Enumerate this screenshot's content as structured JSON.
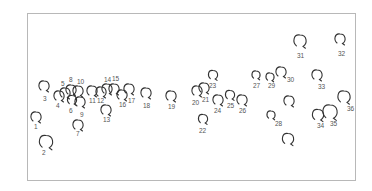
{
  "figure": {
    "border_color": "#b8b8b8",
    "stroke_color": "#333333",
    "label_color": "#555555"
  },
  "items": [
    {
      "id": "1",
      "cx": 36,
      "cy": 117,
      "r": 5,
      "lx": 34,
      "ly": 129
    },
    {
      "id": "2",
      "cx": 46,
      "cy": 142,
      "r": 6.5,
      "lx": 42,
      "ly": 155
    },
    {
      "id": "3",
      "cx": 44,
      "cy": 86,
      "r": 5,
      "lx": 43,
      "ly": 101
    },
    {
      "id": "4",
      "cx": 59,
      "cy": 96,
      "r": 5,
      "lx": 56,
      "ly": 108
    },
    {
      "id": "5",
      "cx": 65,
      "cy": 93,
      "r": 5,
      "lx": 61,
      "ly": 86
    },
    {
      "id": "6",
      "cx": 72,
      "cy": 100,
      "r": 4.5,
      "lx": 69,
      "ly": 113
    },
    {
      "id": "7",
      "cx": 78,
      "cy": 125,
      "r": 5,
      "lx": 76,
      "ly": 136
    },
    {
      "id": "8",
      "cx": 71,
      "cy": 90,
      "r": 5,
      "lx": 69,
      "ly": 82
    },
    {
      "id": "9",
      "cx": 80,
      "cy": 102,
      "r": 5,
      "lx": 80,
      "ly": 117
    },
    {
      "id": "10",
      "cx": 78,
      "cy": 91,
      "r": 5,
      "lx": 77,
      "ly": 84
    },
    {
      "id": "11",
      "cx": 92,
      "cy": 91,
      "r": 5,
      "lx": 89,
      "ly": 103
    },
    {
      "id": "12",
      "cx": 101,
      "cy": 92,
      "r": 5,
      "lx": 97,
      "ly": 103
    },
    {
      "id": "13",
      "cx": 106,
      "cy": 110,
      "r": 5,
      "lx": 103,
      "ly": 122
    },
    {
      "id": "14",
      "cx": 107,
      "cy": 89,
      "r": 5,
      "lx": 104,
      "ly": 82
    },
    {
      "id": "15",
      "cx": 114,
      "cy": 89,
      "r": 5,
      "lx": 112,
      "ly": 81
    },
    {
      "id": "16",
      "cx": 122,
      "cy": 95,
      "r": 5,
      "lx": 119,
      "ly": 107
    },
    {
      "id": "17",
      "cx": 129,
      "cy": 89,
      "r": 5,
      "lx": 128,
      "ly": 103
    },
    {
      "id": "18",
      "cx": 146,
      "cy": 93,
      "r": 5,
      "lx": 143,
      "ly": 108
    },
    {
      "id": "19",
      "cx": 171,
      "cy": 96,
      "r": 5,
      "lx": 168,
      "ly": 109
    },
    {
      "id": "20",
      "cx": 197,
      "cy": 91,
      "r": 5,
      "lx": 192,
      "ly": 105
    },
    {
      "id": "21",
      "cx": 204,
      "cy": 88,
      "r": 5,
      "lx": 202,
      "ly": 102
    },
    {
      "id": "22",
      "cx": 203,
      "cy": 119,
      "r": 4.5,
      "lx": 199,
      "ly": 133
    },
    {
      "id": "23",
      "cx": 213,
      "cy": 75,
      "r": 4.5,
      "lx": 209,
      "ly": 88
    },
    {
      "id": "24",
      "cx": 218,
      "cy": 100,
      "r": 5,
      "lx": 214,
      "ly": 113
    },
    {
      "id": "25",
      "cx": 230,
      "cy": 95,
      "r": 4.5,
      "lx": 227,
      "ly": 108
    },
    {
      "id": "26",
      "cx": 242,
      "cy": 100,
      "r": 5,
      "lx": 239,
      "ly": 113
    },
    {
      "id": "27",
      "cx": 256,
      "cy": 75,
      "r": 4,
      "lx": 253,
      "ly": 88
    },
    {
      "id": "28",
      "cx": 271,
      "cy": 115,
      "r": 4,
      "lx": 275,
      "ly": 126
    },
    {
      "id": "29",
      "cx": 270,
      "cy": 77,
      "r": 4,
      "lx": 268,
      "ly": 88
    },
    {
      "id": "30",
      "cx": 281,
      "cy": 72,
      "r": 5,
      "lx": 287,
      "ly": 82
    },
    {
      "id": "31",
      "cx": 300,
      "cy": 41,
      "r": 6,
      "lx": 297,
      "ly": 58
    },
    {
      "id": "32",
      "cx": 340,
      "cy": 39,
      "r": 5,
      "lx": 338,
      "ly": 56
    },
    {
      "id": "33",
      "cx": 317,
      "cy": 75,
      "r": 5,
      "lx": 318,
      "ly": 89
    },
    {
      "id": "34",
      "cx": 318,
      "cy": 115,
      "r": 5.5,
      "lx": 317,
      "ly": 128
    },
    {
      "id": "35",
      "cx": 330,
      "cy": 112,
      "r": 7,
      "lx": 330,
      "ly": 126
    },
    {
      "id": "36",
      "cx": 344,
      "cy": 97,
      "r": 6,
      "lx": 347,
      "ly": 111
    }
  ],
  "unlabeled": [
    {
      "cx": 289,
      "cy": 101,
      "r": 5
    },
    {
      "cx": 288,
      "cy": 139,
      "r": 5.5
    }
  ]
}
